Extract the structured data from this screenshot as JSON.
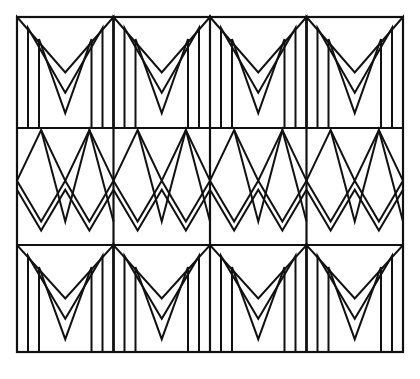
{
  "artwork": {
    "title": "Geometric Chevron and Zigzag Band Pattern",
    "description": "Line drawing of a rectangular panel divided into a 3-row by 4-column grid. Top and bottom rows contain nested M-shaped chevrons with vertical legs; the middle row contains interlocking diamond and double zigzag bands.",
    "medium": "black ink line drawing on white ground",
    "background_color": "#ffffff",
    "line_color": "#111111"
  },
  "canvas": {
    "width": 420,
    "height": 379
  },
  "frame": {
    "label": "outer-panel-border",
    "x": 17,
    "y": 17,
    "width": 386,
    "height": 335,
    "stroke_width": 2.2
  },
  "grid": {
    "columns": 4,
    "rows": 3,
    "column_x": [
      17,
      113.5,
      210,
      306.5,
      403
    ],
    "row_y": [
      17,
      128,
      245,
      352
    ],
    "divider_stroke_width": 2.2,
    "row_labels": [
      "chevron-row-top",
      "zigzag-row-middle",
      "chevron-row-bottom"
    ]
  },
  "motifs": {
    "chevron": {
      "name": "nested-m-chevron",
      "nesting_count": 3,
      "nest_inset": 11,
      "stroke_width": 2.0,
      "description": "Three concentric M shapes: outer apexes touch the cell top corners and centre, inner copies are inset and terminate in vertical legs reaching the cell base."
    },
    "zigzag": {
      "name": "diamond-double-zigzag",
      "peaks": 2,
      "stroke_width": 2.0,
      "band_offset": 9,
      "description": "An upward zigzag of two peaks overlaid by a doubled downward zigzag, forming lozenge voids where the strokes cross."
    }
  },
  "cells": [
    {
      "row": 0,
      "col": 0,
      "motif": "nested-m-chevron",
      "name": "cell-r0-c0"
    },
    {
      "row": 0,
      "col": 1,
      "motif": "nested-m-chevron",
      "name": "cell-r0-c1"
    },
    {
      "row": 0,
      "col": 2,
      "motif": "nested-m-chevron",
      "name": "cell-r0-c2"
    },
    {
      "row": 0,
      "col": 3,
      "motif": "nested-m-chevron",
      "name": "cell-r0-c3"
    },
    {
      "row": 1,
      "col": 0,
      "motif": "diamond-double-zigzag",
      "name": "cell-r1-c0"
    },
    {
      "row": 1,
      "col": 1,
      "motif": "diamond-double-zigzag",
      "name": "cell-r1-c1"
    },
    {
      "row": 1,
      "col": 2,
      "motif": "diamond-double-zigzag",
      "name": "cell-r1-c2"
    },
    {
      "row": 1,
      "col": 3,
      "motif": "diamond-double-zigzag",
      "name": "cell-r1-c3"
    },
    {
      "row": 2,
      "col": 0,
      "motif": "nested-m-chevron",
      "name": "cell-r2-c0"
    },
    {
      "row": 2,
      "col": 1,
      "motif": "nested-m-chevron",
      "name": "cell-r2-c1"
    },
    {
      "row": 2,
      "col": 2,
      "motif": "nested-m-chevron",
      "name": "cell-r2-c2"
    },
    {
      "row": 2,
      "col": 3,
      "motif": "nested-m-chevron",
      "name": "cell-r2-c3"
    }
  ]
}
